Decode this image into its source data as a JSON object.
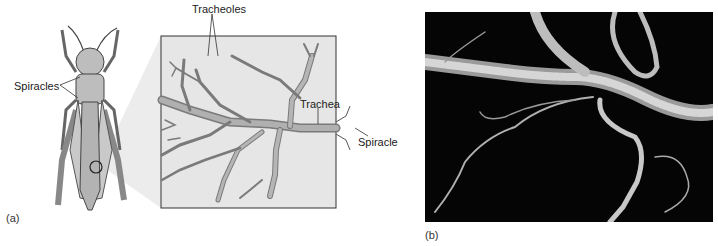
{
  "figure": {
    "panel_a": {
      "label": "(a)",
      "labels": {
        "spiracles": "Spiracles",
        "tracheoles": "Tracheoles",
        "trachea": "Trachea",
        "spiracle": "Spiracle"
      }
    },
    "panel_b": {
      "label": "(b)"
    }
  },
  "colors": {
    "line": "#3a3a3a",
    "tube_fill": "#a8a8a8",
    "box_fill": "#e6e6e6",
    "insect_fill": "#bdbdbd",
    "photo_bg": "#050505",
    "photo_tube": "#cfcfcf"
  }
}
